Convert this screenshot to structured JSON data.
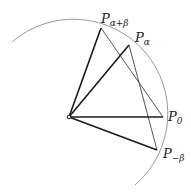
{
  "diagram": {
    "type": "unit-circle angle-addition geometry",
    "colors": {
      "background": "#ffffff",
      "stroke": "#1a1a1a",
      "arc": "#999999",
      "thin": "#444444"
    },
    "center": {
      "x": 69,
      "y": 117
    },
    "radius": 94,
    "points": [
      {
        "id": "P_alpha_plus_beta",
        "label": "P",
        "sub": "α+β",
        "x": 101,
        "y": 28
      },
      {
        "id": "P_alpha",
        "label": "P",
        "sub": "α",
        "x": 129,
        "y": 45
      },
      {
        "id": "P_0",
        "label": "P",
        "sub": "0",
        "x": 163,
        "y": 117
      },
      {
        "id": "P_minus_beta",
        "label": "P",
        "sub": "−β",
        "x": 157,
        "y": 150
      }
    ],
    "thick_segments": [
      "O-P_alpha_plus_beta",
      "O-P_alpha",
      "O-P_0",
      "O-P_minus_beta"
    ],
    "thin_segments": [
      "P_alpha_plus_beta-P_0",
      "P_alpha-P_minus_beta"
    ]
  }
}
